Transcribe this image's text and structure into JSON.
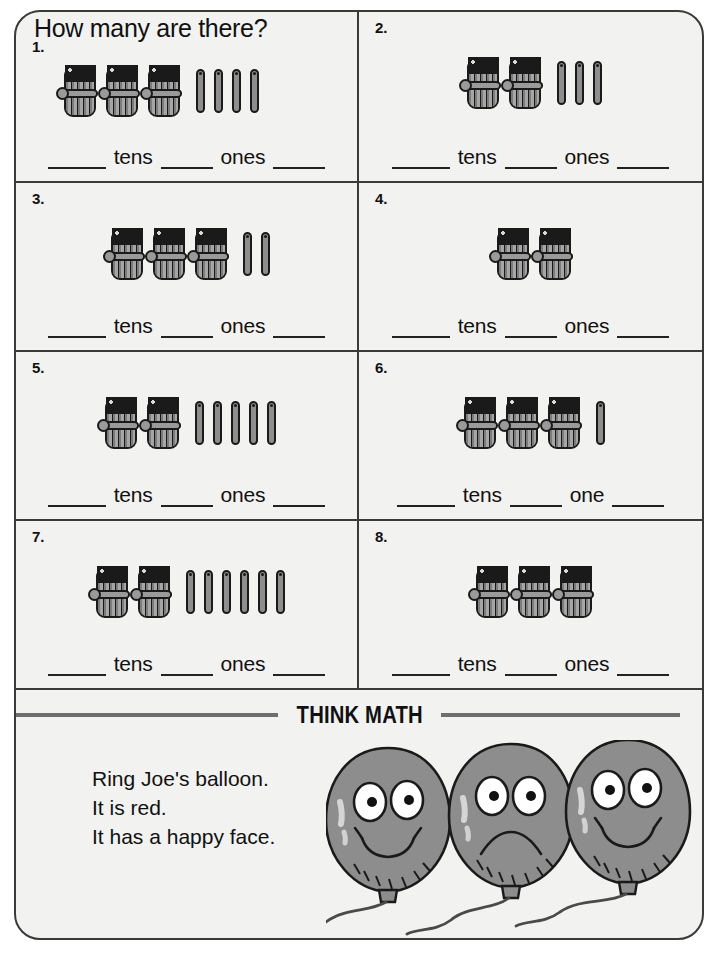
{
  "worksheet": {
    "heading": "How many are there?",
    "problems": [
      {
        "number": "1.",
        "bundles": 3,
        "sticks": 4,
        "tens_label": "tens",
        "ones_label": "ones",
        "align": "left"
      },
      {
        "number": "2.",
        "bundles": 2,
        "sticks": 3,
        "tens_label": "tens",
        "ones_label": "ones",
        "align": "center"
      },
      {
        "number": "3.",
        "bundles": 3,
        "sticks": 2,
        "tens_label": "tens",
        "ones_label": "ones",
        "align": "center"
      },
      {
        "number": "4.",
        "bundles": 2,
        "sticks": 0,
        "tens_label": "tens",
        "ones_label": "ones",
        "align": "center"
      },
      {
        "number": "5.",
        "bundles": 2,
        "sticks": 5,
        "tens_label": "tens",
        "ones_label": "ones",
        "align": "center"
      },
      {
        "number": "6.",
        "bundles": 3,
        "sticks": 1,
        "tens_label": "tens",
        "ones_label": "one",
        "align": "center"
      },
      {
        "number": "7.",
        "bundles": 2,
        "sticks": 6,
        "tens_label": "tens",
        "ones_label": "ones",
        "align": "center"
      },
      {
        "number": "8.",
        "bundles": 3,
        "sticks": 0,
        "tens_label": "tens",
        "ones_label": "ones",
        "align": "center"
      }
    ]
  },
  "think_math": {
    "title": "THINK MATH",
    "lines": [
      "Ring Joe's balloon.",
      "It is red.",
      "It has a happy face."
    ],
    "balloons": [
      {
        "face": "happy"
      },
      {
        "face": "sad"
      },
      {
        "face": "happy"
      }
    ]
  },
  "colors": {
    "page_background": "#f2f2f0",
    "border": "#3a3a38",
    "ink": "#111111",
    "object_fill": "#8e8e8e",
    "balloon_fill": "#8d8d8d",
    "rule": "#6e6e6e"
  }
}
